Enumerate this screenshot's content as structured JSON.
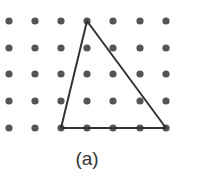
{
  "figure": {
    "label": "(a)",
    "grid": {
      "cols": 7,
      "rows": 5,
      "x": [
        9,
        35,
        61,
        87,
        113,
        140,
        166
      ],
      "y": [
        21,
        48,
        74,
        101,
        128
      ],
      "dot_radius": 3.6,
      "dot_color": "#555555"
    },
    "triangle": {
      "vertices_grid": [
        [
          3,
          0
        ],
        [
          2,
          4
        ],
        [
          6,
          4
        ]
      ],
      "vertices_px": [
        [
          87,
          21
        ],
        [
          61,
          128
        ],
        [
          166,
          128
        ]
      ],
      "stroke_color": "#333333",
      "stroke_width": 2
    }
  }
}
